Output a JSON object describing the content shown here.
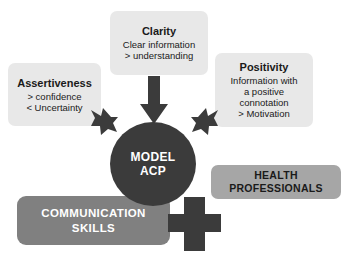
{
  "diagram": {
    "title_center": {
      "line1": "MODEL",
      "line2": "ACP"
    },
    "cards": [
      {
        "key": "clarity",
        "title": "Clarity",
        "lines": [
          "Clear information",
          "> understanding"
        ]
      },
      {
        "key": "assertiveness",
        "title": "Assertiveness",
        "lines": [
          "> confidence",
          "< Uncertainty"
        ]
      },
      {
        "key": "positivity",
        "title": "Positivity",
        "lines": [
          "Information with",
          "a positive",
          "connotation",
          "> Motivation"
        ]
      }
    ],
    "banners": [
      {
        "key": "communication",
        "line1": "COMMUNICATION",
        "line2": "SKILLS"
      },
      {
        "key": "health",
        "line1": "HEALTH",
        "line2": "PROFESSIONALS"
      }
    ],
    "arrows": [
      {
        "key": "clarity-arrow",
        "direction": "down"
      },
      {
        "key": "assertiveness-arrow",
        "direction": "down-right"
      },
      {
        "key": "positivity-arrow",
        "direction": "down-left"
      }
    ],
    "plus_symbol": "+",
    "colors": {
      "background": "#ffffff",
      "card_fill": "#e8e8e8",
      "circle_fill": "#3b3b3b",
      "arrow_fill": "#3b3b3b",
      "banner_communication_fill": "#808080",
      "banner_health_fill": "#a6a6a6",
      "text_dark": "#1a1a1a",
      "text_light": "#ffffff"
    }
  }
}
